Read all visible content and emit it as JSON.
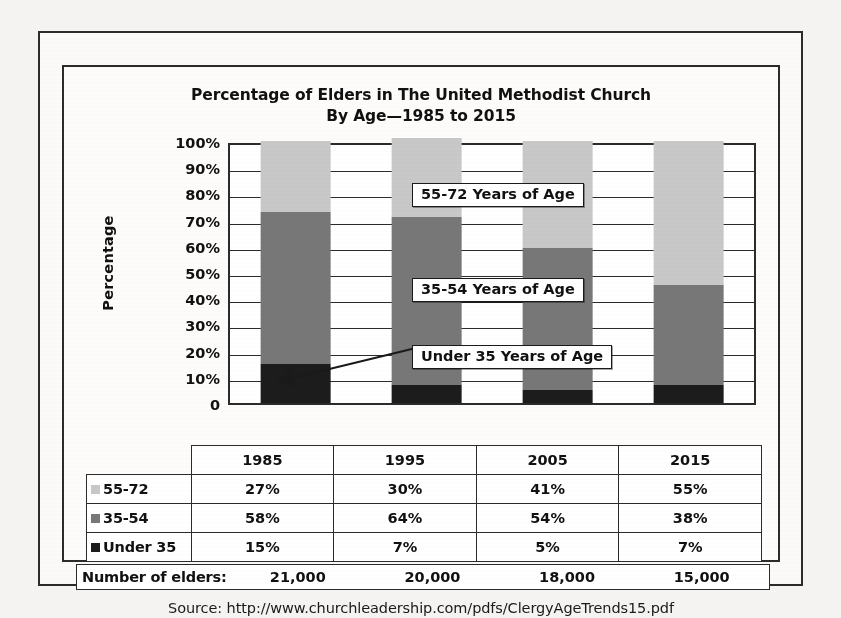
{
  "chart_data": {
    "type": "bar",
    "subtype": "stacked-bar-100",
    "title": "Percentage of Elders in The United Methodist Church",
    "subtitle": "By Age—1985 to 2015",
    "xlabel": "",
    "ylabel": "Percentage",
    "ylim": [
      0,
      100
    ],
    "grid": true,
    "legend_position": "table-row-labels",
    "categories": [
      "1985",
      "1995",
      "2005",
      "2015"
    ],
    "series": [
      {
        "name": "Under 35",
        "color": "#1c1c1c",
        "values": [
          15,
          7,
          5,
          7
        ]
      },
      {
        "name": "35-54",
        "color": "#777777",
        "values": [
          58,
          64,
          54,
          38
        ]
      },
      {
        "name": "55-72",
        "color": "#c8c8c8",
        "values": [
          27,
          30,
          41,
          55
        ]
      }
    ],
    "ytick_labels": [
      "100%",
      "90%",
      "80%",
      "70%",
      "60%",
      "50%",
      "40%",
      "30%",
      "20%",
      "10%",
      "0"
    ],
    "ytick_values": [
      100,
      90,
      80,
      70,
      60,
      50,
      40,
      30,
      20,
      10,
      0
    ],
    "annotations": [
      {
        "text": "55-72 Years of Age",
        "target_series": "55-72"
      },
      {
        "text": "35-54 Years of Age",
        "target_series": "35-54"
      },
      {
        "text": "Under 35 Years of Age",
        "target_series": "Under 35",
        "arrow": true
      }
    ],
    "elders_counts": [
      "21,000",
      "20,000",
      "18,000",
      "15,000"
    ],
    "elders_label": "Number of elders:",
    "source": "Source: http://www.churchleadership.com/pdfs/ClergyAgeTrends15.pdf"
  },
  "table": {
    "year_headers": [
      "1985",
      "1995",
      "2005",
      "2015"
    ],
    "rows": [
      {
        "label": "55-72",
        "swatch": "#c8c8c8",
        "values": [
          "27%",
          "30%",
          "41%",
          "55%"
        ]
      },
      {
        "label": "35-54",
        "swatch": "#777777",
        "values": [
          "58%",
          "64%",
          "54%",
          "38%"
        ]
      },
      {
        "label": "Under 35",
        "swatch": "#1c1c1c",
        "values": [
          "15%",
          "7%",
          "5%",
          "7%"
        ]
      }
    ]
  },
  "colors": {
    "series_55_72": "#c8c8c8",
    "series_35_54": "#777777",
    "series_under_35": "#1c1c1c",
    "frame": "#2b2b2b",
    "page_background": "#fbfaf8"
  }
}
